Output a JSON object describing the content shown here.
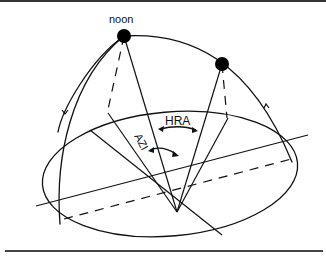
{
  "diagram": {
    "labels": {
      "noon": "noon",
      "hra": "HRA",
      "azi": "AZI"
    },
    "colors": {
      "line": "#111111",
      "sun": "#000000",
      "background": "#ffffff",
      "rule": "#333333"
    }
  }
}
